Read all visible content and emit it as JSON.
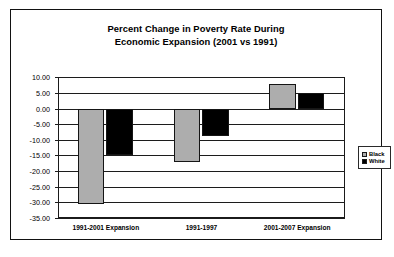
{
  "chart_data": {
    "type": "bar",
    "title": "Percent Change in Poverty Rate During Economic Expansion (2001 vs 1991)",
    "title_line1": "Percent Change in Poverty Rate During",
    "title_line2": "Economic Expansion (2001 vs 1991)",
    "xlabel": "",
    "ylabel": "",
    "categories": [
      "1991-2001 Expansion",
      "1991-1997",
      "2001-2007 Expansion"
    ],
    "series": [
      {
        "name": "Black",
        "color": "#adadad",
        "values": [
          -30.5,
          -17.0,
          7.7
        ]
      },
      {
        "name": "White",
        "color": "#000000",
        "values": [
          -14.8,
          -8.7,
          4.9
        ]
      }
    ],
    "ylim": [
      -35,
      10
    ],
    "ytick_values": [
      10,
      5,
      0,
      -5,
      -10,
      -15,
      -20,
      -25,
      -30,
      -35
    ],
    "ytick_labels": [
      "10.00",
      "5.00",
      "0.00",
      "-5.00",
      "-10.00",
      "-15.00",
      "-20.00",
      "-25.00",
      "-30.00",
      "-35.00"
    ],
    "grid": true,
    "legend_position": "right",
    "legend_entries": [
      "Black",
      "White"
    ]
  }
}
